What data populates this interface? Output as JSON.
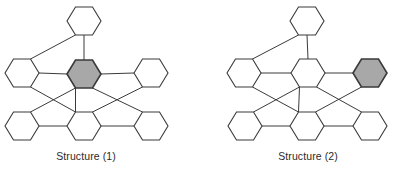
{
  "figure": {
    "width": 393,
    "height": 170,
    "colors": {
      "stroke": "#3a3a3a",
      "fill": "#ffffff",
      "shaded_fill": "#a8a8a8",
      "text": "#2a2a2a"
    },
    "hex": {
      "half_width": 17,
      "half_height": 14
    }
  },
  "structures": [
    {
      "label": "Structure (1)",
      "label_x": 86,
      "label_y": 150,
      "nodes": [
        {
          "id": "top",
          "cx": 84,
          "cy": 21,
          "shaded": false
        },
        {
          "id": "mid-left",
          "cx": 22,
          "cy": 73,
          "shaded": false
        },
        {
          "id": "mid-center",
          "cx": 84,
          "cy": 74,
          "shaded": true
        },
        {
          "id": "mid-right",
          "cx": 151,
          "cy": 73,
          "shaded": false
        },
        {
          "id": "bot-left",
          "cx": 22,
          "cy": 126,
          "shaded": false
        },
        {
          "id": "bot-center",
          "cx": 84,
          "cy": 126,
          "shaded": false
        },
        {
          "id": "bot-right",
          "cx": 151,
          "cy": 126,
          "shaded": false
        }
      ]
    },
    {
      "label": "Structure (2)",
      "label_x": 308,
      "label_y": 150,
      "nodes": [
        {
          "id": "top",
          "cx": 307,
          "cy": 21,
          "shaded": false
        },
        {
          "id": "mid-left",
          "cx": 244,
          "cy": 73,
          "shaded": false
        },
        {
          "id": "mid-center",
          "cx": 308,
          "cy": 73,
          "shaded": false
        },
        {
          "id": "mid-right",
          "cx": 370,
          "cy": 73,
          "shaded": true
        },
        {
          "id": "bot-left",
          "cx": 245,
          "cy": 126,
          "shaded": false
        },
        {
          "id": "bot-center",
          "cx": 307,
          "cy": 126,
          "shaded": false
        },
        {
          "id": "bot-right",
          "cx": 370,
          "cy": 126,
          "shaded": false
        }
      ]
    }
  ],
  "edges": [
    {
      "from": "top",
      "from_v": "bl",
      "to": "mid-left",
      "to_v": "tr"
    },
    {
      "from": "top",
      "from_v": "b",
      "to": "mid-center",
      "to_v": "t"
    },
    {
      "from": "mid-left",
      "from_v": "r",
      "to": "mid-center",
      "to_v": "l"
    },
    {
      "from": "mid-center",
      "from_v": "r",
      "to": "mid-right",
      "to_v": "l"
    },
    {
      "from": "mid-left",
      "from_v": "br",
      "to": "bot-center",
      "to_v": "tl"
    },
    {
      "from": "mid-center",
      "from_v": "bl",
      "to": "bot-left",
      "to_v": "tr"
    },
    {
      "from": "mid-center",
      "from_v": "bl",
      "to": "bot-center",
      "to_v": "tl"
    },
    {
      "from": "mid-center",
      "from_v": "br",
      "to": "bot-right",
      "to_v": "tl"
    },
    {
      "from": "mid-right",
      "from_v": "bl",
      "to": "bot-center",
      "to_v": "tr"
    },
    {
      "from": "bot-left",
      "from_v": "r",
      "to": "bot-center",
      "to_v": "l"
    },
    {
      "from": "bot-center",
      "from_v": "r",
      "to": "bot-right",
      "to_v": "l"
    }
  ]
}
